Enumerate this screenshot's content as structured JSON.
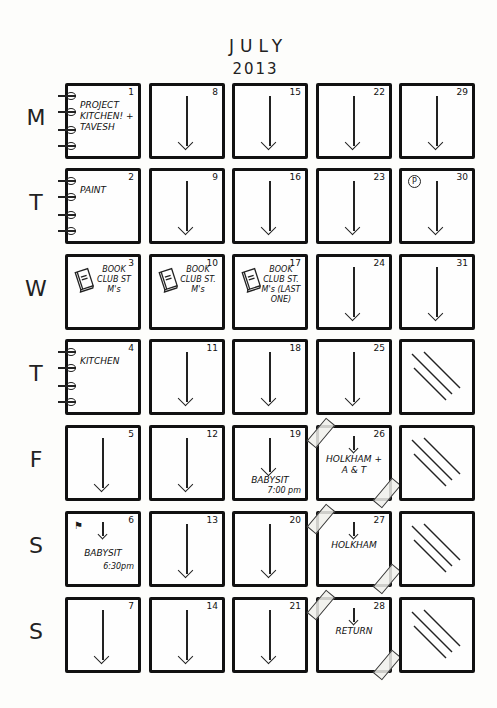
{
  "header": {
    "month": "JULY",
    "year": "2013"
  },
  "day_labels": [
    "M",
    "T",
    "W",
    "T",
    "F",
    "S",
    "S"
  ],
  "grid": {
    "columns": 5,
    "rows": [
      {
        "day": "M",
        "cells": [
          {
            "date": "1",
            "note": "PROJECT KITCHEN! + TAVESH",
            "spiral": true
          },
          {
            "date": "8",
            "arrow": true
          },
          {
            "date": "15",
            "arrow": true
          },
          {
            "date": "22",
            "arrow": true
          },
          {
            "date": "29",
            "arrow": true
          }
        ]
      },
      {
        "day": "T",
        "cells": [
          {
            "date": "2",
            "note": "PAINT",
            "spiral": true
          },
          {
            "date": "9",
            "arrow": true
          },
          {
            "date": "16",
            "arrow": true
          },
          {
            "date": "23",
            "arrow": true
          },
          {
            "date": "30",
            "arrow": true,
            "badge": "P"
          }
        ]
      },
      {
        "day": "W",
        "cells": [
          {
            "date": "3",
            "note": "BOOK CLUB ST M's",
            "book": true
          },
          {
            "date": "10",
            "note": "BOOK CLUB ST. M's",
            "book": true
          },
          {
            "date": "17",
            "note": "BOOK CLUB ST. M's (LAST ONE)",
            "book": true
          },
          {
            "date": "24",
            "arrow": true
          },
          {
            "date": "31",
            "arrow": true
          }
        ]
      },
      {
        "day": "T",
        "cells": [
          {
            "date": "4",
            "note": "KITCHEN",
            "spiral": true
          },
          {
            "date": "11",
            "arrow": true
          },
          {
            "date": "18",
            "arrow": true
          },
          {
            "date": "25",
            "arrow": true
          },
          {
            "date": "",
            "crossed": true
          }
        ]
      },
      {
        "day": "F",
        "cells": [
          {
            "date": "5",
            "arrow": true
          },
          {
            "date": "12",
            "arrow": true
          },
          {
            "date": "19",
            "arrow": true,
            "note": "BABYSIT",
            "subnote": "7:00 pm"
          },
          {
            "date": "26",
            "note": "HOLKHAM + A & T",
            "taped": true
          },
          {
            "date": "",
            "crossed": true
          }
        ]
      },
      {
        "day": "S",
        "cells": [
          {
            "date": "6",
            "note": "BABYSIT",
            "subnote": "6:30pm"
          },
          {
            "date": "13",
            "arrow": true
          },
          {
            "date": "20",
            "arrow": true
          },
          {
            "date": "27",
            "note": "HOLKHAM",
            "taped": true
          },
          {
            "date": "",
            "crossed": true
          }
        ]
      },
      {
        "day": "S",
        "cells": [
          {
            "date": "7",
            "arrow": true
          },
          {
            "date": "14",
            "arrow": true
          },
          {
            "date": "21",
            "arrow": true
          },
          {
            "date": "28",
            "note": "RETURN",
            "taped": true
          },
          {
            "date": "",
            "crossed": true
          }
        ]
      }
    ]
  }
}
